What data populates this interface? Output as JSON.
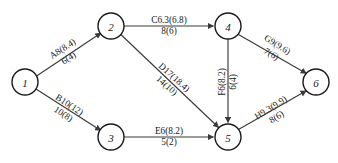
{
  "diagram": {
    "nodes": [
      {
        "id": "n1",
        "label": "1",
        "cx": 25,
        "cy": 82,
        "r": 13
      },
      {
        "id": "n2",
        "label": "2",
        "cx": 111,
        "cy": 26,
        "r": 13
      },
      {
        "id": "n3",
        "label": "3",
        "cx": 111,
        "cy": 137,
        "r": 13
      },
      {
        "id": "n4",
        "label": "4",
        "cx": 228,
        "cy": 26,
        "r": 13
      },
      {
        "id": "n5",
        "label": "5",
        "cx": 228,
        "cy": 137,
        "r": 13
      },
      {
        "id": "n6",
        "label": "6",
        "cx": 316,
        "cy": 82,
        "r": 13
      }
    ],
    "edges": [
      {
        "id": "e12",
        "from": "1",
        "to": "2",
        "top": "A8(8.4)",
        "bottom": "6(4)",
        "lx": 66,
        "ly": 54,
        "rot": -33
      },
      {
        "id": "e13",
        "from": "1",
        "to": "3",
        "top": "B10(12)",
        "bottom": "10(8)",
        "lx": 66,
        "ly": 110,
        "rot": 33
      },
      {
        "id": "e24",
        "from": "2",
        "to": "4",
        "top": "C6.3(6.8)",
        "bottom": "8(6)",
        "lx": 169,
        "ly": 26,
        "rot": 0
      },
      {
        "id": "e25",
        "from": "2",
        "to": "5",
        "top": "D17(18.4)",
        "bottom": "14(10)",
        "lx": 170,
        "ly": 82,
        "rot": 42
      },
      {
        "id": "e35",
        "from": "3",
        "to": "5",
        "top": "E6(8.2)",
        "bottom": "5(2)",
        "lx": 169,
        "ly": 137,
        "rot": 0
      },
      {
        "id": "e45",
        "from": "4",
        "to": "5",
        "top": "F6(8.2)",
        "bottom": "6(4)",
        "lx": 228,
        "ly": 82,
        "rot": -90
      },
      {
        "id": "e46",
        "from": "4",
        "to": "6",
        "top": "G9(9.6)",
        "bottom": "7(6)",
        "lx": 274,
        "ly": 50,
        "rot": 32
      },
      {
        "id": "e56",
        "from": "5",
        "to": "6",
        "top": "H9.3(9.9)",
        "bottom": "8(6)",
        "lx": 274,
        "ly": 113,
        "rot": -32
      }
    ],
    "colors": {
      "node_stroke": "#1a1a1a",
      "edge_stroke": "#3a3a3a",
      "text": "#171717",
      "background": "#ffffff"
    }
  }
}
